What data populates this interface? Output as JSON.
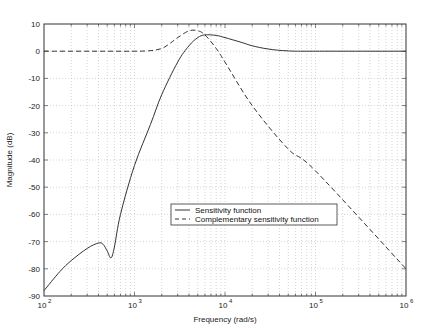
{
  "chart_data": {
    "type": "line",
    "title": "",
    "xlabel": "Frequency (rad/s)",
    "ylabel": "Magnitude (dB)",
    "xscale": "log",
    "xlim": [
      100,
      1000000
    ],
    "ylim": [
      -90,
      10
    ],
    "grid": true,
    "x_tick_labels": [
      "10^2",
      "10^3",
      "10^4",
      "10^5",
      "10^6"
    ],
    "y_tick_labels": [
      "10",
      "0",
      "-10",
      "-20",
      "-30",
      "-40",
      "-50",
      "-60",
      "-70",
      "-80",
      "-90"
    ],
    "legend_position": "center-right, lower middle",
    "series": [
      {
        "name": "Sensitivity function",
        "style": "solid",
        "x": [
          100,
          150,
          200,
          300,
          400,
          450,
          500,
          550,
          600,
          700,
          1000,
          1500,
          2000,
          3000,
          4000,
          5000,
          6000,
          8000,
          10000,
          15000,
          20000,
          30000,
          50000,
          100000,
          1000000
        ],
        "y": [
          -88,
          -81,
          -77,
          -72.5,
          -70.5,
          -71,
          -73.5,
          -76,
          -72,
          -60,
          -42,
          -27,
          -16,
          -4,
          2,
          5,
          6,
          5.8,
          5,
          3.3,
          2,
          0.8,
          0.1,
          0,
          0
        ]
      },
      {
        "name": "Complementary sensitivity function",
        "style": "dashed",
        "x": [
          100,
          500,
          1000,
          1500,
          2000,
          2500,
          3000,
          4000,
          5000,
          6000,
          8000,
          10000,
          20000,
          50000,
          100000,
          1000000
        ],
        "y": [
          0,
          0,
          0,
          0.2,
          1,
          3,
          5,
          7.5,
          7.5,
          6,
          1,
          -4,
          -20,
          -36,
          -44,
          -80
        ]
      }
    ]
  },
  "axes": {
    "xlabel": "Frequency (rad/s)",
    "ylabel": "Magnitude (dB)",
    "x_ticks": [
      {
        "base": "10",
        "exp": "2"
      },
      {
        "base": "10",
        "exp": "3"
      },
      {
        "base": "10",
        "exp": "4"
      },
      {
        "base": "10",
        "exp": "5"
      },
      {
        "base": "10",
        "exp": "6"
      }
    ],
    "y_ticks": [
      "10",
      "0",
      "-10",
      "-20",
      "-30",
      "-40",
      "-50",
      "-60",
      "-70",
      "-80",
      "-90"
    ]
  },
  "legend": {
    "items": [
      "Sensitivity function",
      "Complementary sensitivity function"
    ]
  }
}
